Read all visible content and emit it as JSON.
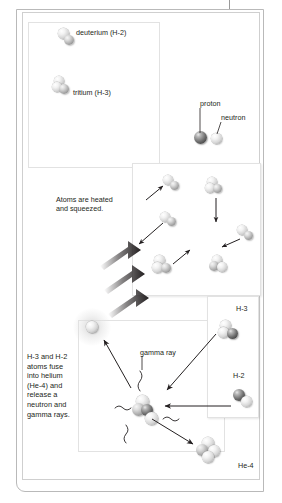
{
  "figure": {
    "topic": "nuclear-fusion",
    "labels": {
      "deuterium": "deuterium (H-2)",
      "tritium": "tritium (H-3)",
      "proton": "proton",
      "neutron": "neutron",
      "heated": "Atoms are heated\nand squeezed.",
      "gamma_ray": "gamma ray",
      "fusion_caption": "H-3 and H-2 atoms fuse into helium (He-4) and release a neutron and gamma rays.",
      "h3": "H-3",
      "h2": "H-2",
      "he4": "He-4"
    },
    "colors": {
      "proton": "#3d3d3d",
      "neutron": "#e8e8e8",
      "arrow": "#231f20",
      "panel_border": "#e2e2e2",
      "page_border": "#b9b9b9"
    },
    "panels": [
      {
        "name": "key-panel",
        "label": "particle key"
      },
      {
        "name": "heating-panel",
        "label": "atoms heated and squeezed"
      },
      {
        "name": "fusion-panel",
        "label": "fusion reaction"
      },
      {
        "name": "reactants-panel",
        "label": "H-3 and H-2 reactants"
      }
    ]
  }
}
